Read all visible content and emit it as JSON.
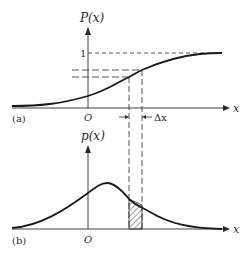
{
  "figure": {
    "panel_a": {
      "label": "(a)",
      "y_axis_label": "P(x)",
      "x_axis_label": "x",
      "origin_label": "O",
      "level_one_label": "1",
      "delta_label": "Δx",
      "curve": "cumulative distribution function"
    },
    "panel_b": {
      "label": "(b)",
      "y_axis_label": "p(x)",
      "x_axis_label": "x",
      "origin_label": "O",
      "curve": "probability density function",
      "shaded_region": "hatched strip of width Δx"
    },
    "colors": {
      "ink": "#2a2a2a",
      "background": "#ffffff"
    }
  }
}
